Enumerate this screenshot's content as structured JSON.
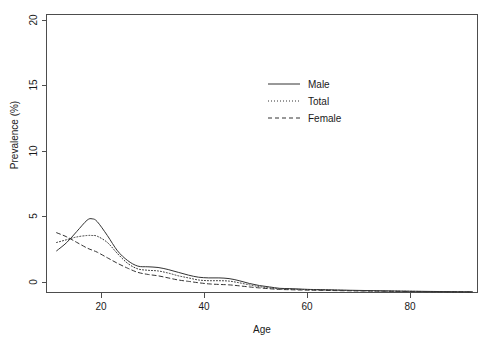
{
  "chart_data": {
    "type": "line",
    "title": "",
    "xlabel": "Age",
    "ylabel": "Prevalence (%)",
    "xlim": [
      10,
      95
    ],
    "ylim": [
      0,
      20
    ],
    "xticks": [
      20,
      40,
      60,
      80
    ],
    "yticks": [
      0,
      5,
      10,
      15,
      20
    ],
    "xtick_labels": [
      "20",
      "40",
      "60",
      "80"
    ],
    "ytick_labels": [
      "0",
      "5",
      "10",
      "15",
      "20"
    ],
    "grid": false,
    "legend_position": "top-center-right",
    "x": [
      12,
      14,
      16,
      18,
      19,
      20,
      22,
      24,
      26,
      28,
      30,
      32,
      34,
      36,
      38,
      40,
      42,
      44,
      46,
      48,
      50,
      52,
      54,
      56,
      58,
      60,
      62,
      65,
      70,
      75,
      80,
      85,
      90,
      94
    ],
    "series": [
      {
        "name": "Male",
        "style": "solid",
        "color": "#333333",
        "values": [
          3.0,
          3.6,
          4.4,
          5.2,
          5.3,
          5.1,
          4.1,
          3.0,
          2.3,
          1.9,
          1.85,
          1.8,
          1.65,
          1.45,
          1.25,
          1.1,
          1.05,
          1.05,
          1.0,
          0.85,
          0.65,
          0.5,
          0.4,
          0.3,
          0.28,
          0.25,
          0.22,
          0.2,
          0.16,
          0.13,
          0.1,
          0.08,
          0.06,
          0.05
        ]
      },
      {
        "name": "Total",
        "style": "dotted",
        "color": "#333333",
        "values": [
          3.6,
          3.8,
          4.0,
          4.1,
          4.1,
          4.05,
          3.6,
          2.8,
          2.1,
          1.7,
          1.6,
          1.55,
          1.4,
          1.2,
          1.05,
          0.9,
          0.85,
          0.85,
          0.82,
          0.7,
          0.55,
          0.42,
          0.33,
          0.26,
          0.24,
          0.22,
          0.2,
          0.18,
          0.14,
          0.11,
          0.09,
          0.07,
          0.05,
          0.04
        ]
      },
      {
        "name": "Female",
        "style": "dashed",
        "color": "#333333",
        "values": [
          4.3,
          4.0,
          3.6,
          3.2,
          3.05,
          2.9,
          2.5,
          2.1,
          1.75,
          1.45,
          1.3,
          1.2,
          1.05,
          0.9,
          0.8,
          0.7,
          0.62,
          0.58,
          0.55,
          0.48,
          0.4,
          0.33,
          0.27,
          0.22,
          0.2,
          0.18,
          0.17,
          0.15,
          0.12,
          0.1,
          0.08,
          0.06,
          0.05,
          0.04
        ]
      }
    ],
    "legend": [
      {
        "label": "Male",
        "style": "solid"
      },
      {
        "label": "Total",
        "style": "dotted"
      },
      {
        "label": "Female",
        "style": "dashed"
      }
    ]
  }
}
